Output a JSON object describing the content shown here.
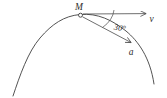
{
  "figure": {
    "labels": {
      "point": "M",
      "velocity": "v",
      "acceleration": "a",
      "angle": "30°"
    },
    "colors": {
      "background": "#ffffff",
      "stroke": "#3f3f3f",
      "text": "#2e2e2e"
    }
  }
}
